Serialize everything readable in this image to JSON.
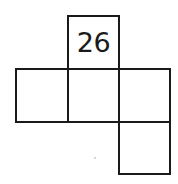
{
  "diagram": {
    "type": "cube-net",
    "cells": [
      {
        "id": "top",
        "row": 0,
        "col": 1,
        "label": "26"
      },
      {
        "id": "middle-left",
        "row": 1,
        "col": 0,
        "label": ""
      },
      {
        "id": "middle-center",
        "row": 1,
        "col": 1,
        "label": ""
      },
      {
        "id": "middle-right",
        "row": 1,
        "col": 2,
        "label": ""
      },
      {
        "id": "bottom-right",
        "row": 2,
        "col": 2,
        "label": ""
      }
    ],
    "colors": {
      "line": "#1a1a1a",
      "background": "#ffffff"
    }
  }
}
